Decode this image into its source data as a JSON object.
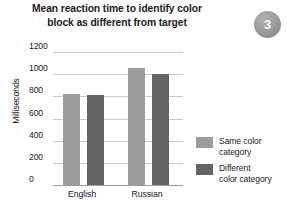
{
  "badge": {
    "label": "3",
    "color": "#9d9d9d"
  },
  "axis": {
    "y_title": "Milliseconds"
  },
  "legend": {
    "items": [
      {
        "label_line1": "Same color",
        "label_line2": "category",
        "color": "#9d9d9d",
        "icon": "legend-swatch-same"
      },
      {
        "label_line1": "Different",
        "label_line2": "color category",
        "color": "#646464",
        "icon": "legend-swatch-different"
      }
    ]
  },
  "title_lines": {
    "line1": "Mean reaction time to identify color",
    "line2": "block as different from target"
  },
  "chart_data": {
    "type": "bar",
    "title": "Mean reaction time to identify color block as different from target",
    "xlabel": "",
    "ylabel": "Milliseconds",
    "ylim": [
      0,
      1200
    ],
    "yticks": [
      0,
      200,
      400,
      600,
      800,
      1000,
      1200
    ],
    "ytick_labels": [
      "0",
      "200",
      "400",
      "600",
      "800",
      "1000",
      "1200"
    ],
    "grid": true,
    "legend_position": "right",
    "categories": [
      "English",
      "Russian"
    ],
    "series": [
      {
        "name": "Same color category",
        "color": "#9d9d9d",
        "values": [
          820,
          1060
        ]
      },
      {
        "name": "Different color category",
        "color": "#646464",
        "values": [
          810,
          1000
        ]
      }
    ]
  }
}
